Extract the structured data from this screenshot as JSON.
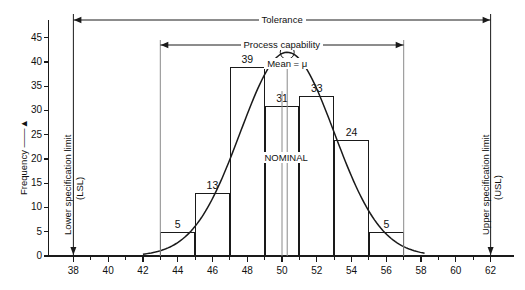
{
  "chart_data": {
    "type": "bar",
    "title": "",
    "xlabel": "",
    "ylabel": "Frequency",
    "xlim": [
      37,
      63
    ],
    "ylim": [
      0,
      47
    ],
    "grid": false,
    "legend": "none",
    "categories": [
      "43-45",
      "45-47",
      "47-49",
      "49-51",
      "51-53",
      "53-55",
      "55-57"
    ],
    "values": [
      5,
      13,
      39,
      31,
      33,
      24,
      5
    ],
    "bar_edges": [
      43,
      45,
      47,
      49,
      51,
      53,
      55,
      57
    ],
    "bar_labels": [
      "5",
      "13",
      "39",
      "31",
      "33",
      "24",
      "5"
    ],
    "x_ticks": [
      38,
      40,
      42,
      44,
      46,
      48,
      50,
      52,
      54,
      56,
      58,
      60,
      62
    ],
    "x_tick_labels": [
      "38",
      "40",
      "42",
      "44",
      "46",
      "48",
      "50",
      "52",
      "54",
      "56",
      "58",
      "60",
      "62"
    ],
    "x_minor_ticks": [
      39,
      41,
      43,
      45,
      47,
      49,
      51,
      53,
      55,
      57,
      59,
      61
    ],
    "y_ticks": [
      0,
      5,
      10,
      15,
      20,
      25,
      30,
      35,
      40,
      45
    ],
    "y_tick_labels": [
      "0",
      "5",
      "10",
      "15",
      "20",
      "25",
      "30",
      "35",
      "40",
      "45"
    ],
    "overlay_curve": {
      "type": "normal",
      "mean": 50.3,
      "sigma": 2.7,
      "peak": 42,
      "x_start": 42,
      "x_end": 58.2
    },
    "markers": {
      "lsl": 38,
      "usl": 62,
      "process_capability_low": 43,
      "process_capability_high": 57,
      "nominal": 50,
      "mean": 50.3
    }
  },
  "axes": {
    "y_axis_label": "Frequency",
    "y_axis_arrow": "up-arrow"
  },
  "annotations": {
    "tolerance": "Tolerance",
    "process_capability": "Process capability",
    "mean": "Mean = μ",
    "nominal": "NOMINAL",
    "lsl_line1": "Lower specification limit",
    "lsl_line2": "(LSL)",
    "usl_line1": "Upper specification limit",
    "usl_line2": "(USL)"
  },
  "colors": {
    "ink": "#1a1a1a",
    "background": "#ffffff"
  }
}
